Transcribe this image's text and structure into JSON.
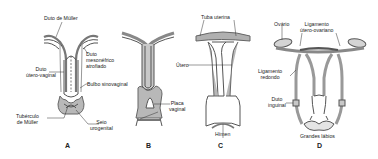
{
  "diagram": {
    "colors": {
      "fill": "#a8a8a8",
      "stroke": "#555555",
      "light": "#d4d4d4",
      "text": "#222222"
    },
    "panels": [
      {
        "id": "A",
        "label": "A",
        "labels": [
          "Duto de Müller",
          "Duto mesonéfrico atrofiado",
          "Duto útero-vaginal",
          "Bulbo sinovaginal",
          "Tubérculo de Müller",
          "Seio urogenital"
        ]
      },
      {
        "id": "B",
        "label": "B",
        "labels": [
          "Placa vaginal"
        ]
      },
      {
        "id": "C",
        "label": "C",
        "labels": [
          "Tuba uterina",
          "Útero",
          "Hímen"
        ]
      },
      {
        "id": "D",
        "label": "D",
        "labels": [
          "Ovário",
          "Ligamento útero-ovariano",
          "Ligamento redondo",
          "Duto inguinal",
          "Grandes lábios"
        ]
      }
    ]
  },
  "labels": {
    "duto_muller": "Duto de Müller",
    "duto_meso_1": "Duto",
    "duto_meso_2": "mesonéfrico",
    "duto_meso_3": "atrofiado",
    "duto_utero_1": "Duto",
    "duto_utero_2": "útero-vaginal",
    "bulbo": "Bulbo sinovaginal",
    "tuberculo_1": "Tubérculo",
    "tuberculo_2": "de Müller",
    "seio_1": "Seio",
    "seio_2": "urogenital",
    "placa_1": "Placa",
    "placa_2": "vaginal",
    "tuba": "Tuba uterina",
    "utero": "Útero",
    "himen": "Hímen",
    "ovario": "Ovário",
    "lig_uo_1": "Ligamento",
    "lig_uo_2": "útero-ovariano",
    "lig_red_1": "Ligamento",
    "lig_red_2": "redondo",
    "duto_ing_1": "Duto",
    "duto_ing_2": "inguinal",
    "grandes": "Grandes lábios",
    "panel_a": "A",
    "panel_b": "B",
    "panel_c": "C",
    "panel_d": "D"
  }
}
